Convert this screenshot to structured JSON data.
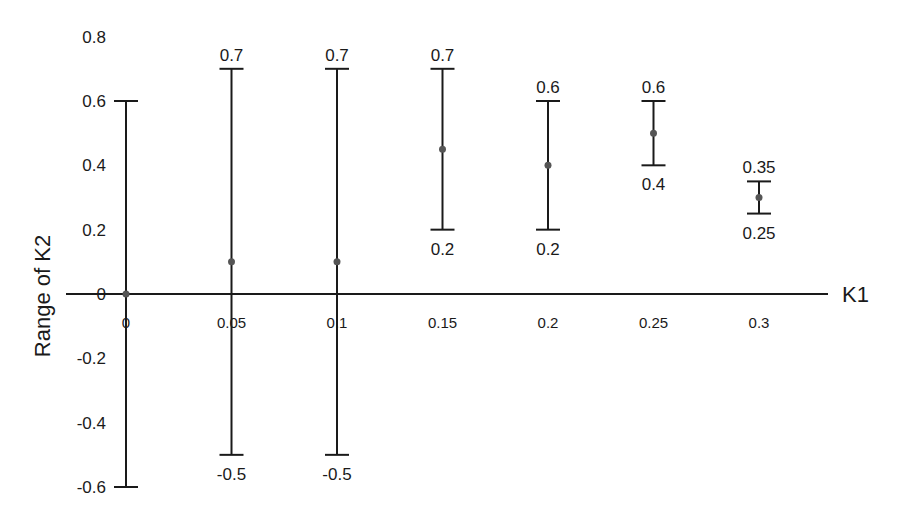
{
  "chart_data": {
    "type": "errorbar",
    "title": "",
    "xlabel": "K1",
    "ylabel": "Range of K2",
    "x_ticks": [
      "0",
      "0.05",
      "0.1",
      "0.15",
      "0.2",
      "0.25",
      "0.3"
    ],
    "y_ticks": [
      "0.8",
      "0.6",
      "0.4",
      "0.2",
      "0",
      "-0.2",
      "-0.4",
      "-0.6"
    ],
    "ylim": [
      -0.6,
      0.8
    ],
    "grid": false,
    "legend": null,
    "points": [
      {
        "x": 0,
        "y": 0,
        "upper": 0.6,
        "lower": -0.6,
        "upper_label": "",
        "lower_label": ""
      },
      {
        "x": 0.05,
        "y": 0.1,
        "upper": 0.7,
        "lower": -0.5,
        "upper_label": "0.7",
        "lower_label": "-0.5"
      },
      {
        "x": 0.1,
        "y": 0.1,
        "upper": 0.7,
        "lower": -0.5,
        "upper_label": "0.7",
        "lower_label": "-0.5"
      },
      {
        "x": 0.15,
        "y": 0.45,
        "upper": 0.7,
        "lower": 0.2,
        "upper_label": "0.7",
        "lower_label": "0.2"
      },
      {
        "x": 0.2,
        "y": 0.4,
        "upper": 0.6,
        "lower": 0.2,
        "upper_label": "0.6",
        "lower_label": "0.2"
      },
      {
        "x": 0.25,
        "y": 0.5,
        "upper": 0.6,
        "lower": 0.4,
        "upper_label": "0.6",
        "lower_label": "0.4"
      },
      {
        "x": 0.3,
        "y": 0.3,
        "upper": 0.35,
        "lower": 0.25,
        "upper_label": "0.35",
        "lower_label": "0.25"
      }
    ]
  },
  "colors": {
    "axis": "#1a1a1a",
    "bar": "#1a1a1a",
    "point": "#555555"
  }
}
